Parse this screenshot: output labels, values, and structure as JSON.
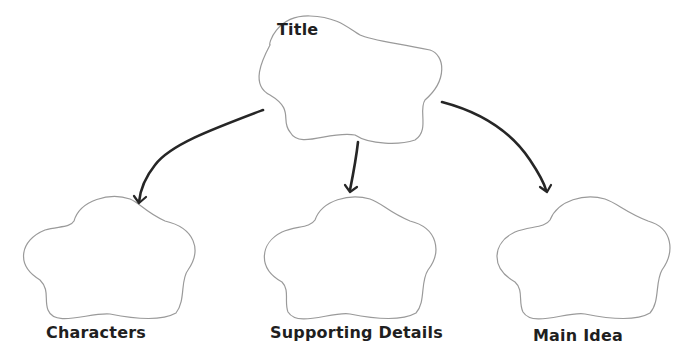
{
  "diagram": {
    "type": "graphic-organizer",
    "nodes": [
      {
        "id": "title",
        "label": "Title",
        "shape": "cloud"
      },
      {
        "id": "characters",
        "label": "Characters",
        "shape": "cloud"
      },
      {
        "id": "supporting_details",
        "label": "Supporting Details",
        "shape": "cloud"
      },
      {
        "id": "main_idea",
        "label": "Main Idea",
        "shape": "cloud"
      }
    ],
    "edges": [
      {
        "from": "title",
        "to": "characters"
      },
      {
        "from": "title",
        "to": "supporting_details"
      },
      {
        "from": "title",
        "to": "main_idea"
      }
    ],
    "colors": {
      "outline": "#9a9a9a",
      "arrow": "#262626",
      "text": "#1f1f1f"
    }
  }
}
